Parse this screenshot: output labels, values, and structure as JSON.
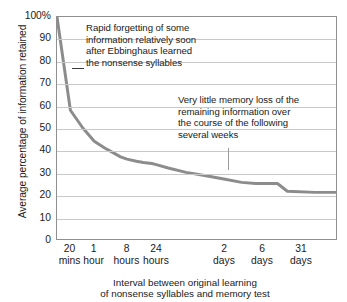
{
  "chart_data": {
    "type": "line",
    "title": "",
    "xlabel": "Interval between original learning of nonsense syllables and memory test",
    "ylabel": "Average percentage of information retained",
    "ylim": [
      0,
      100
    ],
    "grid": true,
    "legend": "none",
    "categories": [
      "20 mins",
      "1 hour",
      "8 hours",
      "24 hours",
      "2 days",
      "6 days",
      "31 days"
    ],
    "y_ticks": [
      "100%",
      "90",
      "80",
      "70",
      "60",
      "50",
      "40",
      "30",
      "20",
      "10",
      "0"
    ],
    "y_tick_values": [
      100,
      90,
      80,
      70,
      60,
      50,
      40,
      30,
      20,
      10,
      0
    ],
    "x_tick_labels": [
      {
        "value": "20",
        "unit": "mins"
      },
      {
        "value": "1",
        "unit": "hour"
      },
      {
        "value": "8",
        "unit": "hours"
      },
      {
        "value": "24",
        "unit": "hours"
      },
      {
        "value": "2",
        "unit": "days"
      },
      {
        "value": "6",
        "unit": "days"
      },
      {
        "value": "31",
        "unit": "days"
      }
    ],
    "series": [
      {
        "name": "Retention",
        "color": "#8c8c8c",
        "points": [
          {
            "x": 0.0,
            "y": 100
          },
          {
            "x": 13.5,
            "y": 58
          },
          {
            "x": 26.0,
            "y": 50
          },
          {
            "x": 37.5,
            "y": 44
          },
          {
            "x": 48.0,
            "y": 41
          },
          {
            "x": 56.0,
            "y": 39
          },
          {
            "x": 64.0,
            "y": 37
          },
          {
            "x": 70.5,
            "y": 36
          },
          {
            "x": 80.0,
            "y": 35
          },
          {
            "x": 87.0,
            "y": 34.5
          },
          {
            "x": 95.5,
            "y": 34
          },
          {
            "x": 100.0,
            "y": 33.5
          },
          {
            "x": 112.0,
            "y": 32
          },
          {
            "x": 130.0,
            "y": 30
          },
          {
            "x": 150.0,
            "y": 28.5
          },
          {
            "x": 168.0,
            "y": 27
          },
          {
            "x": 186.0,
            "y": 25.5
          },
          {
            "x": 200.0,
            "y": 25
          },
          {
            "x": 222.0,
            "y": 25
          },
          {
            "x": 232.0,
            "y": 21.5
          },
          {
            "x": 260.0,
            "y": 21
          },
          {
            "x": 281.0,
            "y": 21
          }
        ]
      }
    ],
    "annotations": [
      {
        "id": "rapid-forgetting",
        "text": "Rapid forgetting of some\ninformation relatively soon\nafter Ebbinghaus learned\nthe nonsense syllables",
        "leader": "horizontal-dash"
      },
      {
        "id": "little-loss",
        "text": "Very little memory loss of the\nremaining information over\nthe course of the following\nseveral weeks",
        "leader": "vertical-line"
      }
    ],
    "colors": {
      "curve": "#8c8c8c",
      "grid": "#c9c9c9",
      "frame": "#8f8f8f",
      "text": "#1a1a1a",
      "background": "#ffffff"
    }
  }
}
